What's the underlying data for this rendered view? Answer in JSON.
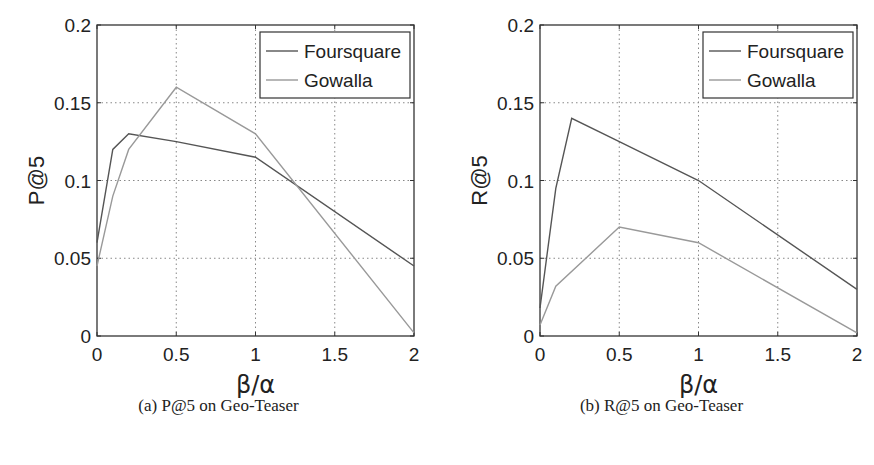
{
  "figure": {
    "captions": [
      "(a) P@5 on Geo-Teaser",
      "(b) R@5 on Geo-Teaser"
    ]
  },
  "colors": {
    "foursquare": "#555555",
    "gowalla": "#999999",
    "axis": "#333333",
    "grid": "#888888"
  },
  "chart_data": [
    {
      "type": "line",
      "title": "",
      "caption": "(a) P@5 on Geo-Teaser",
      "xlabel": "β/α",
      "ylabel": "P@5",
      "xlim": [
        0,
        2
      ],
      "ylim": [
        0,
        0.2
      ],
      "xticks": [
        "0",
        "0.5",
        "1",
        "1.5",
        "2"
      ],
      "yticks": [
        "0",
        "0.05",
        "0.1",
        "0.15",
        "0.2"
      ],
      "grid": true,
      "legend_position": "upper right",
      "series": [
        {
          "name": "Foursquare",
          "x": [
            0,
            0.1,
            0.2,
            0.5,
            1,
            2
          ],
          "values": [
            0.06,
            0.12,
            0.13,
            0.125,
            0.115,
            0.045
          ]
        },
        {
          "name": "Gowalla",
          "x": [
            0,
            0.1,
            0.2,
            0.5,
            1,
            2
          ],
          "values": [
            0.045,
            0.09,
            0.12,
            0.16,
            0.13,
            0.002
          ]
        }
      ]
    },
    {
      "type": "line",
      "title": "",
      "caption": "(b) R@5 on Geo-Teaser",
      "xlabel": "β/α",
      "ylabel": "R@5",
      "xlim": [
        0,
        2
      ],
      "ylim": [
        0,
        0.2
      ],
      "xticks": [
        "0",
        "0.5",
        "1",
        "1.5",
        "2"
      ],
      "yticks": [
        "0",
        "0.05",
        "0.1",
        "0.15",
        "0.2"
      ],
      "grid": true,
      "legend_position": "upper right",
      "series": [
        {
          "name": "Foursquare",
          "x": [
            0,
            0.1,
            0.2,
            0.5,
            1,
            2
          ],
          "values": [
            0.018,
            0.095,
            0.14,
            0.125,
            0.1,
            0.03
          ]
        },
        {
          "name": "Gowalla",
          "x": [
            0,
            0.1,
            0.5,
            1,
            2
          ],
          "values": [
            0.007,
            0.032,
            0.07,
            0.06,
            0.002
          ]
        }
      ]
    }
  ]
}
